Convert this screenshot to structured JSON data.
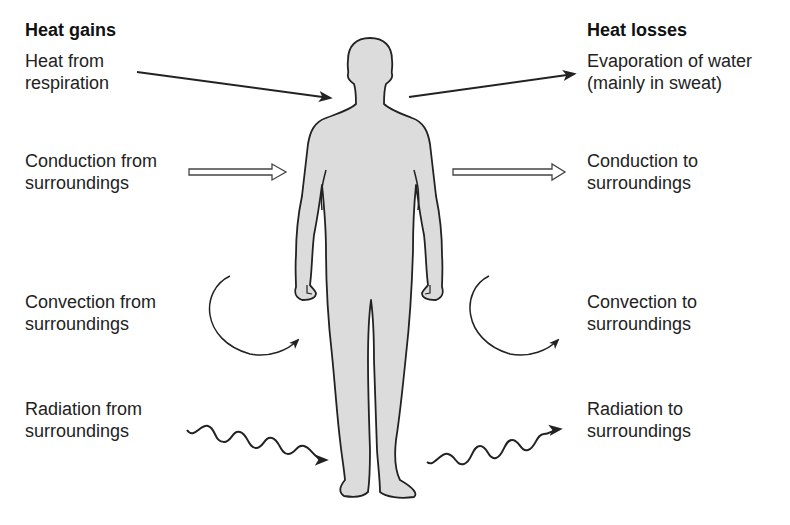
{
  "diagram": {
    "left_heading": "Heat gains",
    "right_heading": "Heat losses",
    "gains": [
      {
        "line1": "Heat from",
        "line2": "respiration",
        "arrow": "solid-straight"
      },
      {
        "line1": "Conduction from",
        "line2": "surroundings",
        "arrow": "hollow-straight"
      },
      {
        "line1": "Convection from",
        "line2": "surroundings",
        "arrow": "curved"
      },
      {
        "line1": "Radiation from",
        "line2": "surroundings",
        "arrow": "wavy"
      }
    ],
    "losses": [
      {
        "line1": "Evaporation of water",
        "line2": "(mainly in sweat)",
        "arrow": "solid-straight"
      },
      {
        "line1": "Conduction to",
        "line2": "surroundings",
        "arrow": "hollow-straight"
      },
      {
        "line1": "Convection to",
        "line2": "surroundings",
        "arrow": "curved"
      },
      {
        "line1": "Radiation to",
        "line2": "surroundings",
        "arrow": "wavy"
      }
    ],
    "figure": "human-body-silhouette",
    "colors": {
      "body_fill": "#dcdcdc",
      "outline": "#222222",
      "text": "#222222"
    }
  }
}
